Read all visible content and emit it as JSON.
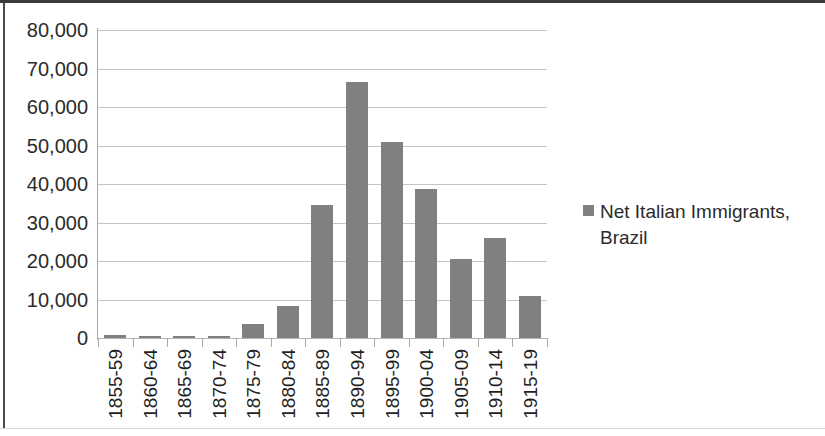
{
  "chart_data": {
    "type": "bar",
    "title": "",
    "subtitle": "",
    "xlabel": "",
    "ylabel": "",
    "orientation": "vertical",
    "grid": true,
    "grid_axis": "y",
    "legend_position": "right",
    "bar_color": "#808080",
    "gridline_color": "#c4c4c4",
    "axis_color": "#a9a9a9",
    "text_color": "#2b2b2b",
    "ylim": [
      0,
      80000
    ],
    "ytick_step": 10000,
    "ytick_labels": [
      "0",
      "10,000",
      "20,000",
      "30,000",
      "40,000",
      "50,000",
      "60,000",
      "70,000",
      "80,000"
    ],
    "ytick_values": [
      0,
      10000,
      20000,
      30000,
      40000,
      50000,
      60000,
      70000,
      80000
    ],
    "categories": [
      "1855-59",
      "1860-64",
      "1865-69",
      "1870-74",
      "1875-79",
      "1880-84",
      "1885-89",
      "1890-94",
      "1895-99",
      "1900-04",
      "1905-09",
      "1910-14",
      "1915-19"
    ],
    "values": [
      700,
      600,
      300,
      600,
      3600,
      8300,
      34500,
      66500,
      51000,
      38800,
      20600,
      26000,
      11000
    ],
    "series": [
      {
        "name": "Net Italian Immigrants, Brazil",
        "color": "#808080",
        "values": [
          700,
          600,
          300,
          600,
          3600,
          8300,
          34500,
          66500,
          51000,
          38800,
          20600,
          26000,
          11000
        ]
      }
    ],
    "legend": [
      {
        "label": "Net Italian Immigrants, Brazil",
        "color": "#808080",
        "marker": "square"
      }
    ]
  }
}
